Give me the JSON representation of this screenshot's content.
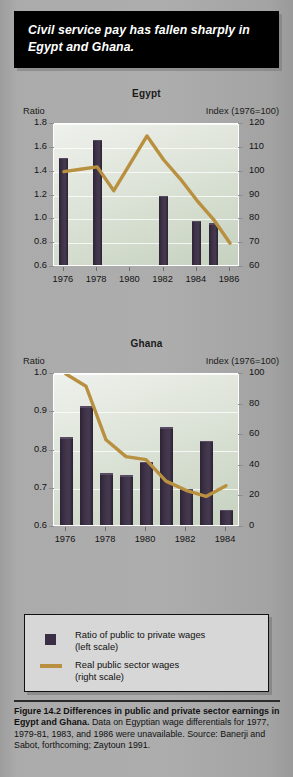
{
  "banner": {
    "text": "Civil service pay has fallen sharply in Egypt and Ghana."
  },
  "legend": {
    "bar_label_line1": "Ratio of public to private wages",
    "bar_label_line2": "(left scale)",
    "line_label_line1": "Real public sector wages",
    "line_label_line2": "(right scale)"
  },
  "caption": {
    "bold_part": "Figure 14.2  Differences in public and private sector earnings in Egypt and Ghana.",
    "rest": " Data on Egyptian wage differentials for 1977, 1979-81, 1983, and 1986 were unavailable. Source: Banerji and Sabot, forthcoming; Zaytoun 1991."
  },
  "colors": {
    "bar": "#3a2e44",
    "line": "#b8903f",
    "banner_bg": "#000000",
    "page_bg": "#a9a9a9",
    "plot_bg_light": "#eef1ec",
    "plot_bg_dark": "#c6d1c0"
  },
  "chart_data": [
    {
      "type": "bar",
      "id": "egypt",
      "title": "Egypt",
      "ylabel": "Ratio",
      "ylabel_right": "Index (1976=100)",
      "xlabel": "",
      "ylim": [
        0.6,
        1.8
      ],
      "ylim_right": [
        60,
        120
      ],
      "yticks": [
        "0.6",
        "0.8",
        "1.0",
        "1.2",
        "1.4",
        "1.6",
        "1.8"
      ],
      "ytick_values": [
        0.6,
        0.8,
        1.0,
        1.2,
        1.4,
        1.6,
        1.8
      ],
      "yticks_right": [
        "60",
        "70",
        "80",
        "90",
        "100",
        "110",
        "120"
      ],
      "ytick_values_right": [
        60,
        70,
        80,
        90,
        100,
        110,
        120
      ],
      "xticks": [
        "1976",
        "1978",
        "1980",
        "1982",
        "1984",
        "1986"
      ],
      "xtick_values": [
        1976,
        1978,
        1980,
        1982,
        1984,
        1986
      ],
      "grid": true,
      "legend_position": "below-figure",
      "series": [
        {
          "name": "Ratio of public to private wages",
          "kind": "bar",
          "axis": "left",
          "x": [
            1976,
            1978,
            1982,
            1984,
            1985
          ],
          "values": [
            1.5,
            1.65,
            1.18,
            0.97,
            0.95
          ]
        },
        {
          "name": "Real public sector wages",
          "kind": "line",
          "axis": "right",
          "x": [
            1976,
            1977,
            1978,
            1979,
            1981,
            1982,
            1983,
            1984,
            1985,
            1986
          ],
          "values": [
            100,
            101,
            102,
            92,
            115,
            105,
            97,
            88,
            80,
            70
          ]
        }
      ]
    },
    {
      "type": "bar",
      "id": "ghana",
      "title": "Ghana",
      "ylabel": "Ratio",
      "ylabel_right": "Index (1976=100)",
      "xlabel": "",
      "ylim": [
        0.6,
        1.0
      ],
      "ylim_right": [
        0,
        100
      ],
      "yticks": [
        "0.6",
        "0.7",
        "0.8",
        "0.9",
        "1.0"
      ],
      "ytick_values": [
        0.6,
        0.7,
        0.8,
        0.9,
        1.0
      ],
      "yticks_right": [
        "0",
        "20",
        "40",
        "60",
        "80",
        "100"
      ],
      "ytick_values_right": [
        0,
        20,
        40,
        60,
        80,
        100
      ],
      "xticks": [
        "1976",
        "1978",
        "1980",
        "1982",
        "1984"
      ],
      "xtick_values": [
        1976,
        1978,
        1980,
        1982,
        1984
      ],
      "grid": true,
      "legend_position": "below-figure",
      "series": [
        {
          "name": "Ratio of public to private wages",
          "kind": "bar",
          "axis": "left",
          "x": [
            1976,
            1977,
            1978,
            1979,
            1980,
            1981,
            1982,
            1983,
            1984
          ],
          "values": [
            0.83,
            0.91,
            0.735,
            0.73,
            0.765,
            0.855,
            0.695,
            0.82,
            0.64
          ]
        },
        {
          "name": "Real public sector wages",
          "kind": "line",
          "axis": "right",
          "x": [
            1976,
            1977,
            1978,
            1979,
            1980,
            1981,
            1982,
            1983,
            1984
          ],
          "values": [
            100,
            92,
            57,
            46,
            44,
            30,
            24,
            20,
            27
          ]
        }
      ]
    }
  ]
}
